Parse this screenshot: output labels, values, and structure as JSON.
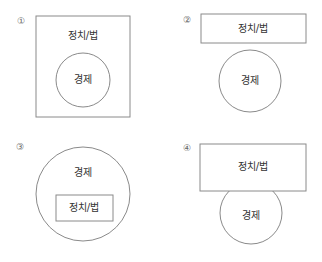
{
  "options": [
    {
      "number": "①",
      "description": "정치/법 rectangle containing 경제 circle",
      "outer_label": "정치/법",
      "inner_label": "경제"
    },
    {
      "number": "②",
      "description": "정치/법 rectangle and 경제 circle separate",
      "rect_label": "정치/법",
      "circle_label": "경제"
    },
    {
      "number": "③",
      "description": "경제 circle containing 정치/법 rectangle",
      "outer_label": "경제",
      "inner_label": "정치/법"
    },
    {
      "number": "④",
      "description": "정치/법 rectangle overlapping 경제 circle",
      "rect_label": "정치/법",
      "circle_label": "경제"
    }
  ],
  "colors": {
    "stroke": "#8a8a8a",
    "text": "#333333",
    "number": "#666666"
  }
}
